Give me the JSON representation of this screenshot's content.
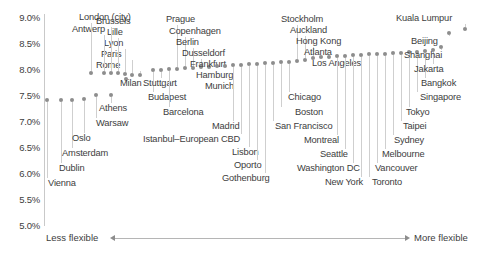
{
  "chart_data": {
    "type": "scatter",
    "title": "",
    "xlabel": "",
    "ylabel": "",
    "ylim": [
      5.0,
      9.0
    ],
    "grid": false,
    "legend": null,
    "y_tick_labels": [
      "9.0%",
      "8.5%",
      "8.0%",
      "7.5%",
      "7.0%",
      "6.5%",
      "6.0%",
      "5.5%",
      "5.0%"
    ],
    "y_tick_values": [
      9.0,
      8.5,
      8.0,
      7.5,
      7.0,
      6.5,
      6.0,
      5.5,
      5.0
    ],
    "x_axis_annotation_left": "Less flexible",
    "x_axis_annotation_right": "More flexible",
    "categories": [
      "Vienna",
      "Dublin",
      "Amsterdam",
      "Oslo",
      "Warsaw",
      "Athens",
      "Milan",
      "Rome",
      "Paris",
      "Lyon",
      "Lille",
      "Brussels",
      "Antwerp",
      "London (city)",
      "Budapest",
      "Stuttgart",
      "Barcelona",
      "Prague",
      "Copenhagen",
      "Berlin",
      "Dusseldorf",
      "Frankfurt",
      "Hamburg",
      "Munich",
      "Madrid",
      "Istanbul–European CBD",
      "Lisbon",
      "Oporto",
      "Gothenburg",
      "San Francisco",
      "Boston",
      "Chicago",
      "Stockholm",
      "Auckland",
      "Hong Kong",
      "Atlanta",
      "Los Angeles",
      "Montreal",
      "Seattle",
      "Washington DC",
      "New York",
      "Toronto",
      "Vancouver",
      "Melbourne",
      "Sydney",
      "Taipei",
      "Tokyo",
      "Singapore",
      "Bangkok",
      "Jakarta",
      "Shanghai",
      "Beijing",
      "Kuala Lumpur"
    ],
    "values": [
      6.93,
      6.93,
      6.93,
      6.95,
      6.98,
      6.98,
      7.45,
      7.52,
      7.52,
      7.55,
      7.58,
      7.58,
      7.58,
      7.58,
      7.78,
      7.8,
      7.82,
      7.84,
      7.86,
      7.86,
      7.88,
      7.88,
      7.9,
      7.9,
      7.92,
      7.92,
      7.94,
      7.94,
      7.96,
      7.96,
      7.98,
      7.98,
      8.0,
      8.02,
      8.08,
      8.1,
      8.1,
      8.12,
      8.12,
      8.14,
      8.14,
      8.16,
      8.16,
      8.16,
      8.18,
      8.18,
      8.2,
      8.2,
      8.22,
      8.24,
      8.3,
      8.55,
      8.62
    ],
    "points": [
      {
        "label": "Vienna",
        "x": 46,
        "y": 98,
        "value": 6.93,
        "label_x": 48,
        "label_y": 178,
        "label_side": "below"
      },
      {
        "label": "Dublin",
        "x": 60,
        "y": 98,
        "value": 6.93,
        "label_x": 59,
        "label_y": 163,
        "label_side": "below"
      },
      {
        "label": "Amsterdam",
        "x": 71,
        "y": 98,
        "value": 6.93,
        "label_x": 62,
        "label_y": 148,
        "label_side": "below"
      },
      {
        "label": "Oslo",
        "x": 83,
        "y": 97,
        "value": 6.95,
        "label_x": 72,
        "label_y": 133,
        "label_side": "below"
      },
      {
        "label": "Warsaw",
        "x": 95,
        "y": 93,
        "value": 6.98,
        "label_x": 96,
        "label_y": 118,
        "label_side": "below"
      },
      {
        "label": "Athens",
        "x": 110,
        "y": 93,
        "value": 6.98,
        "label_x": 99,
        "label_y": 103,
        "label_side": "below"
      },
      {
        "label": "Milan",
        "x": 125,
        "y": 77,
        "value": 7.45,
        "label_x": 120,
        "label_y": 78,
        "label_side": "right"
      },
      {
        "label": "Rome",
        "x": 139,
        "y": 73,
        "value": 7.52,
        "label_x": 96,
        "label_y": 60,
        "label_side": "above"
      },
      {
        "label": "Paris",
        "x": 131,
        "y": 73,
        "value": 7.52,
        "label_x": 101,
        "label_y": 49,
        "label_side": "above"
      },
      {
        "label": "Lyon",
        "x": 124,
        "y": 72,
        "value": 7.55,
        "label_x": 104,
        "label_y": 38,
        "label_side": "above"
      },
      {
        "label": "Lille",
        "x": 117,
        "y": 71,
        "value": 7.58,
        "label_x": 107,
        "label_y": 27,
        "label_side": "above"
      },
      {
        "label": "Brussels",
        "x": 110,
        "y": 71,
        "value": 7.58,
        "label_x": 96,
        "label_y": 16,
        "label_side": "above"
      },
      {
        "label": "Antwerp",
        "x": 103,
        "y": 71,
        "value": 7.58,
        "label_x": 72,
        "label_y": 24,
        "label_side": "above"
      },
      {
        "label": "London (city)",
        "x": 90,
        "y": 71,
        "value": 7.58,
        "label_x": 79,
        "label_y": 12,
        "label_side": "above"
      },
      {
        "label": "Budapest",
        "x": 152,
        "y": 68,
        "value": 7.78,
        "label_x": 148,
        "label_y": 92,
        "label_side": "below"
      },
      {
        "label": "Stuttgart",
        "x": 160,
        "y": 68,
        "value": 7.8,
        "label_x": 143,
        "label_y": 78,
        "label_side": "below"
      },
      {
        "label": "Barcelona",
        "x": 168,
        "y": 67,
        "value": 7.82,
        "label_x": 163,
        "label_y": 107,
        "label_side": "below"
      },
      {
        "label": "Prague",
        "x": 176,
        "y": 67,
        "value": 7.84,
        "label_x": 166,
        "label_y": 14,
        "label_side": "above"
      },
      {
        "label": "Copenhagen",
        "x": 184,
        "y": 66,
        "value": 7.86,
        "label_x": 169,
        "label_y": 26,
        "label_side": "above"
      },
      {
        "label": "Berlin",
        "x": 192,
        "y": 66,
        "value": 7.86,
        "label_x": 176,
        "label_y": 37,
        "label_side": "above"
      },
      {
        "label": "Dusseldorf",
        "x": 200,
        "y": 65,
        "value": 7.88,
        "label_x": 182,
        "label_y": 48,
        "label_side": "above"
      },
      {
        "label": "Frankfurt",
        "x": 208,
        "y": 65,
        "value": 7.88,
        "label_x": 190,
        "label_y": 59,
        "label_side": "above"
      },
      {
        "label": "Hamburg",
        "x": 216,
        "y": 64,
        "value": 7.9,
        "label_x": 196,
        "label_y": 70,
        "label_side": "above"
      },
      {
        "label": "Munich",
        "x": 224,
        "y": 64,
        "value": 7.9,
        "label_x": 205,
        "label_y": 81,
        "label_side": "above"
      },
      {
        "label": "Madrid",
        "x": 232,
        "y": 63,
        "value": 7.92,
        "label_x": 212,
        "label_y": 121,
        "label_side": "below"
      },
      {
        "label": "Istanbul–European CBD",
        "x": 240,
        "y": 63,
        "value": 7.92,
        "label_x": 143,
        "label_y": 134,
        "label_side": "below"
      },
      {
        "label": "Lisbon",
        "x": 248,
        "y": 62,
        "value": 7.94,
        "label_x": 232,
        "label_y": 147,
        "label_side": "below"
      },
      {
        "label": "Oporto",
        "x": 256,
        "y": 62,
        "value": 7.94,
        "label_x": 234,
        "label_y": 160,
        "label_side": "below"
      },
      {
        "label": "Gothenburg",
        "x": 264,
        "y": 61,
        "value": 7.96,
        "label_x": 222,
        "label_y": 173,
        "label_side": "below"
      },
      {
        "label": "San Francisco",
        "x": 272,
        "y": 61,
        "value": 7.96,
        "label_x": 275,
        "label_y": 121,
        "label_side": "below"
      },
      {
        "label": "Boston",
        "x": 280,
        "y": 60,
        "value": 7.98,
        "label_x": 295,
        "label_y": 107,
        "label_side": "below"
      },
      {
        "label": "Chicago",
        "x": 288,
        "y": 60,
        "value": 7.98,
        "label_x": 288,
        "label_y": 92,
        "label_side": "below"
      },
      {
        "label": "Stockholm",
        "x": 296,
        "y": 59,
        "value": 8.0,
        "label_x": 281,
        "label_y": 14,
        "label_side": "above"
      },
      {
        "label": "Auckland",
        "x": 304,
        "y": 58,
        "value": 8.02,
        "label_x": 290,
        "label_y": 25,
        "label_side": "above"
      },
      {
        "label": "Hong Kong",
        "x": 312,
        "y": 56,
        "value": 8.08,
        "label_x": 296,
        "label_y": 36,
        "label_side": "above"
      },
      {
        "label": "Atlanta",
        "x": 320,
        "y": 55,
        "value": 8.1,
        "label_x": 304,
        "label_y": 47,
        "label_side": "above"
      },
      {
        "label": "Los Angeles",
        "x": 328,
        "y": 55,
        "value": 8.1,
        "label_x": 312,
        "label_y": 58,
        "label_side": "above"
      },
      {
        "label": "Montreal",
        "x": 336,
        "y": 54,
        "value": 8.12,
        "label_x": 304,
        "label_y": 135,
        "label_side": "below"
      },
      {
        "label": "Seattle",
        "x": 344,
        "y": 54,
        "value": 8.12,
        "label_x": 320,
        "label_y": 149,
        "label_side": "below"
      },
      {
        "label": "Washington DC",
        "x": 352,
        "y": 53,
        "value": 8.14,
        "label_x": 297,
        "label_y": 163,
        "label_side": "below"
      },
      {
        "label": "New York",
        "x": 360,
        "y": 53,
        "value": 8.14,
        "label_x": 325,
        "label_y": 177,
        "label_side": "below"
      },
      {
        "label": "Toronto",
        "x": 368,
        "y": 52,
        "value": 8.16,
        "label_x": 372,
        "label_y": 177,
        "label_side": "below"
      },
      {
        "label": "Vancouver",
        "x": 376,
        "y": 52,
        "value": 8.16,
        "label_x": 375,
        "label_y": 163,
        "label_side": "below"
      },
      {
        "label": "Melbourne",
        "x": 384,
        "y": 52,
        "value": 8.16,
        "label_x": 382,
        "label_y": 149,
        "label_side": "below"
      },
      {
        "label": "Sydney",
        "x": 392,
        "y": 51,
        "value": 8.18,
        "label_x": 394,
        "label_y": 135,
        "label_side": "below"
      },
      {
        "label": "Taipei",
        "x": 400,
        "y": 51,
        "value": 8.18,
        "label_x": 403,
        "label_y": 121,
        "label_side": "below"
      },
      {
        "label": "Tokyo",
        "x": 408,
        "y": 50,
        "value": 8.2,
        "label_x": 406,
        "label_y": 107,
        "label_side": "below"
      },
      {
        "label": "Singapore",
        "x": 416,
        "y": 50,
        "value": 8.2,
        "label_x": 420,
        "label_y": 92,
        "label_side": "below"
      },
      {
        "label": "Bangkok",
        "x": 424,
        "y": 49,
        "value": 8.22,
        "label_x": 421,
        "label_y": 78,
        "label_side": "below"
      },
      {
        "label": "Jakarta",
        "x": 432,
        "y": 48,
        "value": 8.24,
        "label_x": 414,
        "label_y": 64,
        "label_side": "below"
      },
      {
        "label": "Shanghai",
        "x": 440,
        "y": 45,
        "value": 8.3,
        "label_x": 404,
        "label_y": 50,
        "label_side": "below"
      },
      {
        "label": "Beijing",
        "x": 448,
        "y": 31,
        "value": 8.55,
        "label_x": 411,
        "label_y": 36,
        "label_side": "below"
      },
      {
        "label": "Kuala Lumpur",
        "x": 464,
        "y": 27,
        "value": 8.62,
        "label_x": 396,
        "label_y": 13,
        "label_side": "above"
      }
    ]
  }
}
